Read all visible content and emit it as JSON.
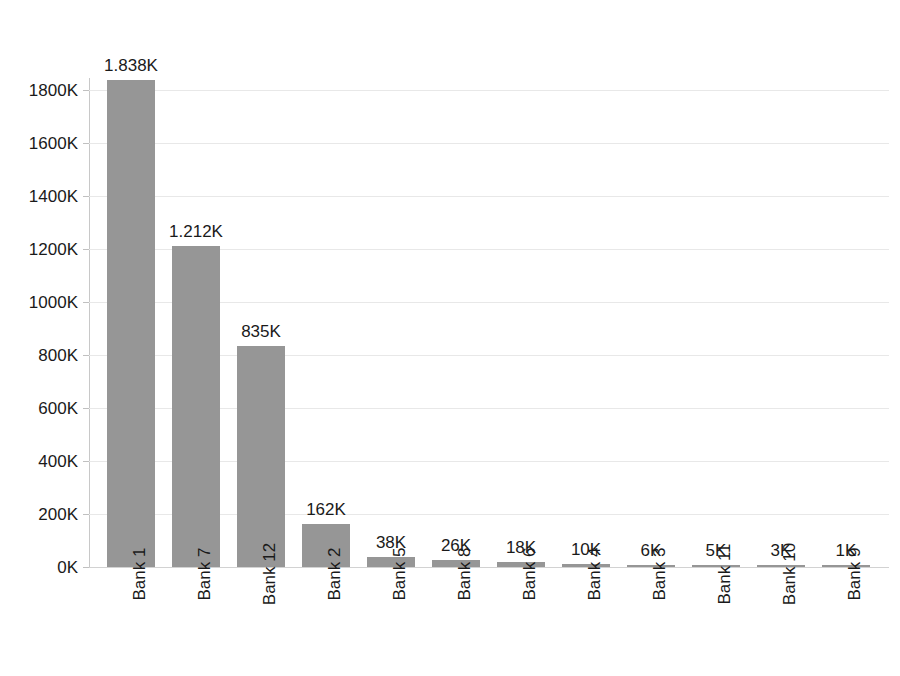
{
  "chart_data": {
    "type": "bar",
    "title": "",
    "subtitle": "",
    "xlabel": "",
    "ylabel": "",
    "categories": [
      "Bank 1",
      "Bank 7",
      "Bank 12",
      "Bank 2",
      "Bank 5",
      "Bank 8",
      "Bank 6",
      "Bank 4",
      "Bank 3",
      "Bank 11",
      "Bank 10",
      "Bank 9"
    ],
    "values": [
      1838,
      1212,
      835,
      162,
      38,
      26,
      18,
      10,
      6,
      5,
      3,
      1
    ],
    "value_unit": "K",
    "data_labels": [
      "1.838K",
      "1.212K",
      "835K",
      "162K",
      "38K",
      "26K",
      "18K",
      "10K",
      "6K",
      "5K",
      "3K",
      "1K"
    ],
    "ylim": [
      0,
      1800
    ],
    "ytick_values": [
      0,
      200,
      400,
      600,
      800,
      1000,
      1200,
      1400,
      1600,
      1800
    ],
    "ytick_labels": [
      "0K",
      "200K",
      "400K",
      "600K",
      "800K",
      "1000K",
      "1200K",
      "1400K",
      "1600K",
      "1800K"
    ],
    "grid": true,
    "legend": false,
    "legend_position": "none",
    "orientation": "vertical",
    "sorted": "descending",
    "xtick_rotation": -90,
    "bar_color": "#969696",
    "gridline_color": "#e8e8e8",
    "axis_color": "#c8c8c8",
    "text_color": "#1a1a1a",
    "background_color": "#ffffff"
  }
}
